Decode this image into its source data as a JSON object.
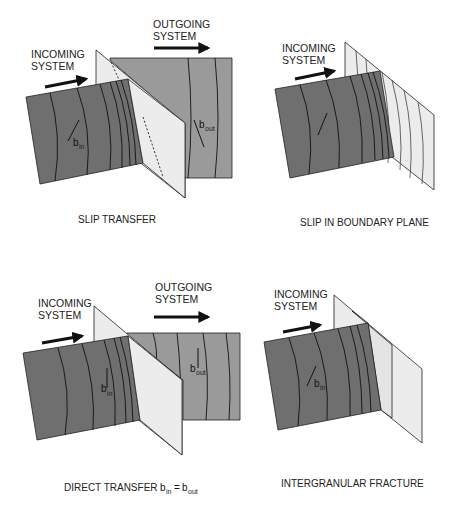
{
  "colors": {
    "incoming_block": "#6f6f6f",
    "outgoing_block": "#9a9a9a",
    "boundary_plane": "#ececec",
    "line": "#111111",
    "text": "#222222"
  },
  "panels": [
    {
      "id": "slip-transfer",
      "incoming_label": [
        "INCOMING",
        "SYSTEM"
      ],
      "outgoing_label": [
        "OUTGOING",
        "SYSTEM"
      ],
      "vector_in": {
        "base": "b",
        "sub": "in"
      },
      "vector_out": {
        "base": "b",
        "sub": "out"
      },
      "caption": "SLIP TRANSFER"
    },
    {
      "id": "slip-in-boundary-plane",
      "incoming_label": [
        "INCOMING",
        "SYSTEM"
      ],
      "caption": "SLIP IN BOUNDARY PLANE"
    },
    {
      "id": "direct-transfer",
      "incoming_label": [
        "INCOMING",
        "SYSTEM"
      ],
      "outgoing_label": [
        "OUTGOING",
        "SYSTEM"
      ],
      "vector_in": {
        "base": "b",
        "sub": "in"
      },
      "vector_out": {
        "base": "b",
        "sub": "out"
      },
      "caption": "DIRECT TRANSFER",
      "equation": {
        "lhs_base": "b",
        "lhs_sub": "in",
        "op": "=",
        "rhs_base": "b",
        "rhs_sub": "out"
      }
    },
    {
      "id": "intergranular-fracture",
      "incoming_label": [
        "INCOMING",
        "SYSTEM"
      ],
      "vector_in": {
        "base": "b",
        "sub": "in"
      },
      "caption": "INTERGRANULAR FRACTURE"
    }
  ]
}
